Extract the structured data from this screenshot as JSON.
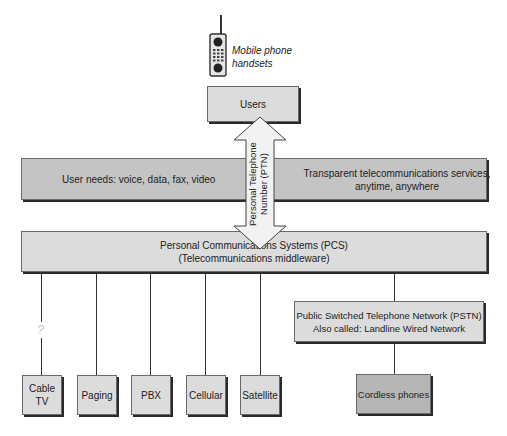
{
  "handset": {
    "caption_line1": "Mobile phone",
    "caption_line2": "handsets"
  },
  "users": {
    "label": "Users"
  },
  "ptn_arrow": {
    "line1": "Personal Telephone",
    "line2": "Number (PTN)"
  },
  "band": {
    "left_text": "User needs: voice, data, fax, video",
    "right_line1": "Transparent telecommunications services,",
    "right_line2": "anytime, anywhere"
  },
  "pcs": {
    "line1": "Personal Communications Systems (PCS)",
    "line2": "(Telecommunications middleware)"
  },
  "uncertain_marker": "?",
  "services": [
    {
      "line1": "Cable",
      "line2": "TV"
    },
    {
      "line1": "Paging",
      "line2": ""
    },
    {
      "line1": "PBX",
      "line2": ""
    },
    {
      "line1": "Cellular",
      "line2": ""
    },
    {
      "line1": "Satellite",
      "line2": ""
    }
  ],
  "pstn": {
    "line1": "Public Switched Telephone Network (PSTN)",
    "line2": "Also called: Landline Wired Network"
  },
  "cordless": {
    "label": "Cordless phones"
  },
  "colors": {
    "light_box": "#dcdcdc",
    "band": "#c4c4c4",
    "cordless_box": "#b6b6b6",
    "question_mark": "#c8c8c8"
  }
}
